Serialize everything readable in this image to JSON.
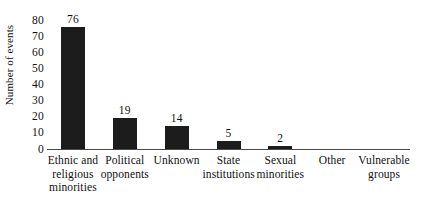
{
  "chart_data": {
    "type": "bar",
    "title": "",
    "subtitle": "",
    "xlabel": "",
    "ylabel": "Number of events",
    "categories": [
      "Ethnic and religious minorities",
      "Political opponents",
      "Unknown",
      "State institutions",
      "Sexual minorities",
      "Other",
      "Vulnerable groups"
    ],
    "category_lines": [
      [
        "Ethnic and",
        "religious",
        "minorities"
      ],
      [
        "Political",
        "opponents"
      ],
      [
        "Unknown"
      ],
      [
        "State",
        "institutions"
      ],
      [
        "Sexual",
        "minorities"
      ],
      [
        "Other"
      ],
      [
        "Vulnerable",
        "groups"
      ]
    ],
    "values": [
      76,
      19,
      14,
      5,
      2,
      0,
      0
    ],
    "value_labels": [
      "76",
      "19",
      "14",
      "5",
      "2",
      "",
      ""
    ],
    "ylim": [
      0,
      80
    ],
    "yticks": [
      0,
      10,
      20,
      30,
      40,
      50,
      60,
      70,
      80
    ],
    "ytick_labels": [
      "0",
      "10",
      "20",
      "30",
      "40",
      "50",
      "60",
      "70",
      "80"
    ],
    "grid": false,
    "legend": false,
    "bar_color": "#1c1c1c",
    "axis_color": "#4a4a4a",
    "background_color": "#ffffff"
  }
}
